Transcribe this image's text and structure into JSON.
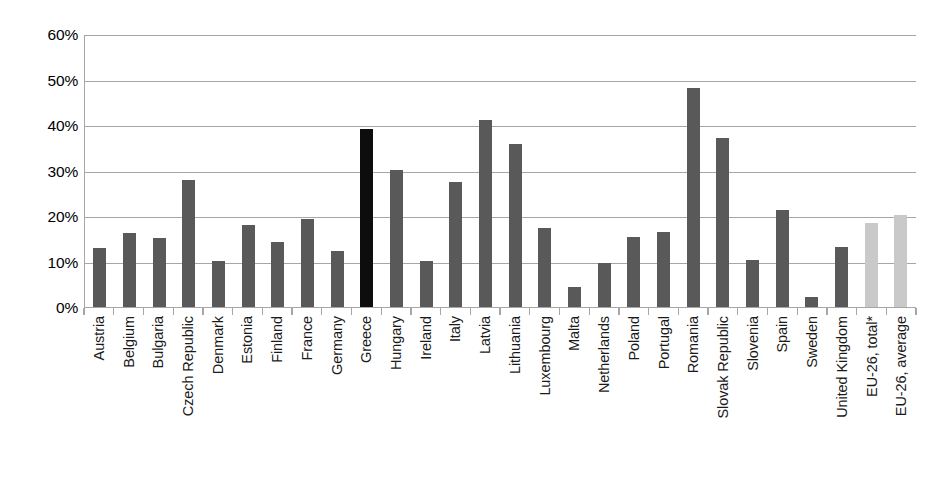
{
  "chart_data": {
    "type": "bar",
    "title": "",
    "subtitle": "",
    "xlabel": "",
    "ylabel": "",
    "ylim": [
      0,
      60
    ],
    "ytick_step": 10,
    "ytick_labels": [
      "60%",
      "50%",
      "40%",
      "30%",
      "20%",
      "10%",
      "0%"
    ],
    "ytick_values": [
      60,
      50,
      40,
      30,
      20,
      10,
      0
    ],
    "grid": true,
    "grid_axis": "y",
    "legend": false,
    "legend_position": "none",
    "value_unit": "percent",
    "categories": [
      "Austria",
      "Belgium",
      "Bulgaria",
      "Czech Republic",
      "Denmark",
      "Estonia",
      "Finland",
      "France",
      "Germany",
      "Greece",
      "Hungary",
      "Ireland",
      "Italy",
      "Latvia",
      "Lithuania",
      "Luxembourg",
      "Malta",
      "Netherlands",
      "Poland",
      "Portugal",
      "Romania",
      "Slovak Republic",
      "Slovenia",
      "Spain",
      "Sweden",
      "United Kingdom",
      "EU-26, total*",
      "EU-26, average"
    ],
    "values": [
      12.9,
      16.3,
      15.1,
      28.0,
      10.1,
      18.0,
      14.3,
      19.3,
      12.3,
      39.1,
      30.2,
      10.2,
      27.4,
      41.0,
      35.9,
      17.3,
      4.3,
      9.6,
      15.3,
      16.5,
      48.2,
      37.2,
      10.4,
      21.4,
      2.3,
      13.1,
      18.5,
      20.3
    ],
    "bar_styles": [
      "normal",
      "normal",
      "normal",
      "normal",
      "normal",
      "normal",
      "normal",
      "normal",
      "normal",
      "highlight",
      "normal",
      "normal",
      "normal",
      "normal",
      "normal",
      "normal",
      "normal",
      "normal",
      "normal",
      "normal",
      "normal",
      "normal",
      "normal",
      "normal",
      "normal",
      "normal",
      "aggregate",
      "aggregate"
    ],
    "colors": {
      "bar_normal": "#595959",
      "bar_highlight": "#0d0d0d",
      "bar_aggregate": "#c9c9c9",
      "gridline": "#a6a6a6",
      "axis": "#a6a6a6",
      "text": "#1a1a1a",
      "background": "#ffffff"
    }
  }
}
